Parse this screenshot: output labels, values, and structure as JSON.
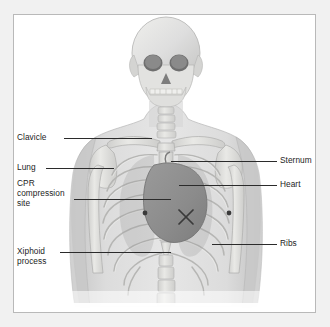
{
  "figure": {
    "background_color": "#f1f1f1",
    "panel_color": "#ffffff",
    "panel_border_color": "#b9b9b9",
    "bone_color": "#d8d8d6",
    "body_silhouette_color": "#cfcfcf",
    "heart_color": "#8e8e8e",
    "marker_color": "#3a3a3a",
    "label_color": "#1c1c1c",
    "leader_color": "#2b2b2b"
  },
  "labels": {
    "left": [
      {
        "id": "clavicle",
        "text": "Clavicle",
        "x": 17,
        "y": 132,
        "leader_x": 63,
        "leader_y": 137,
        "leader_w": 88
      },
      {
        "id": "lung",
        "text": "Lung",
        "x": 17,
        "y": 162,
        "leader_x": 45,
        "leader_y": 167,
        "leader_w": 68
      },
      {
        "id": "cpr-compression",
        "text": "CPR\ncompression\nsite",
        "x": 17,
        "y": 178,
        "leader_x": 73,
        "leader_y": 198,
        "leader_w": 97
      },
      {
        "id": "xiphoid",
        "text": "Xiphoid\nprocess",
        "x": 17,
        "y": 246,
        "leader_x": 59,
        "leader_y": 251,
        "leader_w": 111
      }
    ],
    "right": [
      {
        "id": "sternum",
        "text": "Sternum",
        "x": 280,
        "y": 155,
        "leader_x": 170,
        "leader_y": 160,
        "leader_w": 106
      },
      {
        "id": "heart",
        "text": "Heart",
        "x": 280,
        "y": 179,
        "leader_x": 178,
        "leader_y": 184,
        "leader_w": 98
      },
      {
        "id": "ribs",
        "text": "Ribs",
        "x": 280,
        "y": 238,
        "leader_x": 211,
        "leader_y": 243,
        "leader_w": 65
      }
    ]
  },
  "markers": {
    "compression_cross": {
      "cx": 172,
      "cy": 202,
      "size": 9
    },
    "dots": [
      {
        "id": "left-nipple-marker",
        "cx": 131,
        "cy": 198,
        "r": 2.4
      },
      {
        "id": "right-nipple-marker",
        "cx": 215,
        "cy": 198,
        "r": 2.4
      }
    ]
  }
}
